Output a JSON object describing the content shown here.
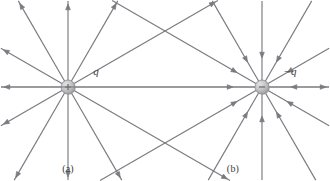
{
  "figure": {
    "type": "electric-field-lines",
    "background_color": "#ffffff",
    "line_color": "#7a7a80",
    "charge_fill_color": "#b9b9bd",
    "charge_stroke_color": "#8a8a8f",
    "label_color": "#3b3b3b",
    "panels": [
      {
        "id": "a",
        "caption": "(a)",
        "charge_label": "q",
        "charge_sign": "+",
        "field_direction": "outward",
        "center": {
          "x": 68,
          "y": 87
        },
        "ray_count": 12,
        "ray_angles_deg": [
          0,
          30,
          60,
          90,
          120,
          150,
          180,
          210,
          240,
          270,
          300,
          330
        ],
        "charge_radius": 7,
        "label_position": {
          "x": 96,
          "y": 75
        }
      },
      {
        "id": "b",
        "caption": "(b)",
        "charge_label": "−q",
        "charge_sign": "−",
        "field_direction": "inward",
        "center": {
          "x": 262,
          "y": 87
        },
        "ray_count": 12,
        "ray_angles_deg": [
          0,
          30,
          60,
          90,
          120,
          150,
          180,
          210,
          240,
          270,
          300,
          330
        ],
        "charge_radius": 7,
        "label_position": {
          "x": 290,
          "y": 75
        }
      }
    ]
  }
}
